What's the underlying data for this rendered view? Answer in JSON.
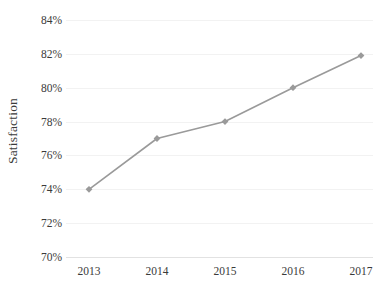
{
  "chart_data": {
    "type": "line",
    "title": "",
    "subtitle": "",
    "xlabel": "",
    "ylabel": "Satisfaction",
    "categories": [
      "2013",
      "2014",
      "2015",
      "2016",
      "2017"
    ],
    "x": [
      2013,
      2014,
      2015,
      2016,
      2017
    ],
    "values": [
      74,
      77,
      78,
      80,
      81.9
    ],
    "series": [
      {
        "name": "Satisfaction",
        "values": [
          74,
          77,
          78,
          80,
          81.9
        ]
      }
    ],
    "ylim": [
      70,
      84
    ],
    "ytick_values": [
      84,
      82,
      80,
      78,
      76,
      74,
      72,
      70
    ],
    "ytick_labels": [
      "84%",
      "82%",
      "80%",
      "78%",
      "76%",
      "74%",
      "72%",
      "70%"
    ],
    "xtick_labels": [
      "2013",
      "2014",
      "2015",
      "2016",
      "2017"
    ],
    "grid": true,
    "grid_axis": "y",
    "legend": false,
    "legend_position": "none",
    "marker": "diamond",
    "annotations": [],
    "colors": {
      "line": "#9a9a9a",
      "marker": "#9a9a9a",
      "grid": "#f2f2f2",
      "axis": "#e2e2e2",
      "text": "#3a3a3a",
      "background": "#ffffff"
    }
  }
}
